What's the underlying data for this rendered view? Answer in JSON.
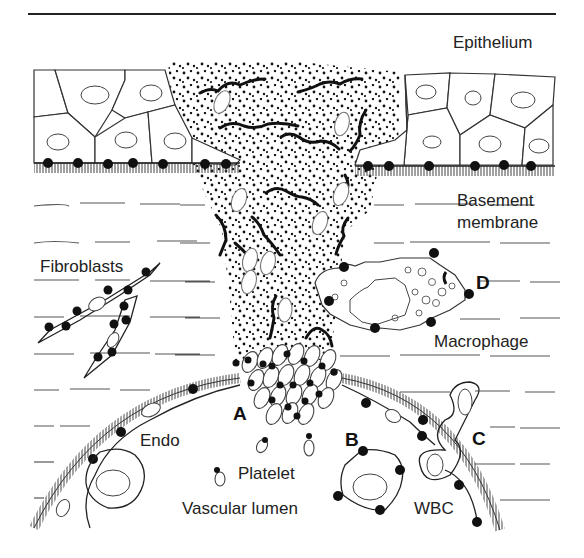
{
  "figure": {
    "type": "wound-healing schematic",
    "labels": {
      "epithelium": "Epithelium",
      "basement_membrane_line1": "Basement",
      "basement_membrane_line2": "membrane",
      "fibroblasts": "Fibroblasts",
      "macrophage": "Macrophage",
      "endo": "Endo",
      "platelet": "Platelet",
      "vascular_lumen": "Vascular lumen",
      "wbc": "WBC"
    },
    "markers": {
      "a": "A",
      "b": "B",
      "c": "C",
      "d": "D"
    },
    "colors": {
      "ink": "#111111",
      "background": "#ffffff",
      "thin_line": "#555555",
      "rbc_outline": "#777777"
    }
  }
}
